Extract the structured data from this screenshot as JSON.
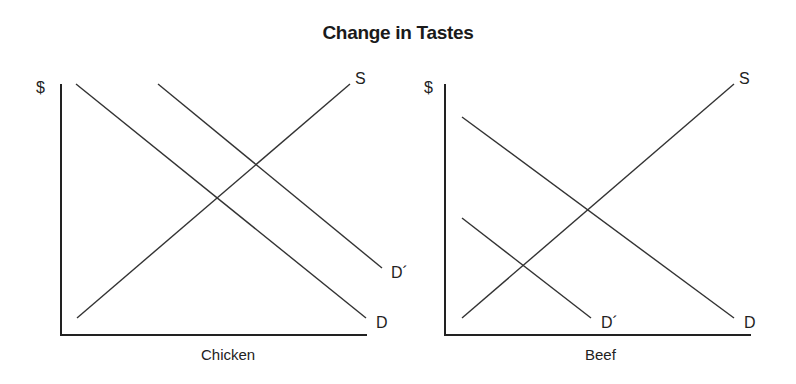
{
  "title": "Change in Tastes",
  "panels": [
    {
      "name": "chicken",
      "y_label": "$",
      "x_label": "Chicken",
      "curves": [
        {
          "label": "S",
          "type": "supply"
        },
        {
          "label": "D",
          "type": "demand"
        },
        {
          "label": "D´",
          "type": "demand-shifted-right"
        }
      ]
    },
    {
      "name": "beef",
      "y_label": "$",
      "x_label": "Beef",
      "curves": [
        {
          "label": "S",
          "type": "supply"
        },
        {
          "label": "D",
          "type": "demand"
        },
        {
          "label": "D´",
          "type": "demand-shifted-left"
        }
      ]
    }
  ],
  "colors": {
    "line": "#333333",
    "axis": "#222222",
    "text": "#222222"
  }
}
